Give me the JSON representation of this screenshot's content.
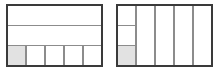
{
  "figure": {
    "background_color": "#ffffff",
    "stroke_color": "#3a3a3a",
    "inner_stroke_color": "#8c8c8c",
    "shade_color": "#e2e2e2",
    "outer_stroke_width": 2,
    "inner_stroke_width": 1.6
  },
  "models": [
    {
      "name": "left-model",
      "label": "rows-then-columns",
      "x": 7,
      "y": 5,
      "width": 95,
      "height": 61,
      "primary_partition": "horizontal",
      "primary_count": 3,
      "secondary_partition": "vertical",
      "secondary_count": 5,
      "secondary_in_band": 3,
      "total_parts": 15,
      "shaded_parts": 1,
      "shaded_cell": {
        "row": 3,
        "column": 1
      },
      "fraction": "1/15",
      "band_dividers_y": [
        25.33,
        45.67
      ],
      "cell_dividers_x": [
        26,
        45,
        64,
        83
      ]
    },
    {
      "name": "right-model",
      "label": "columns-then-rows",
      "x": 117,
      "y": 5,
      "width": 95,
      "height": 61,
      "primary_partition": "vertical",
      "primary_count": 5,
      "secondary_partition": "horizontal",
      "secondary_count": 3,
      "secondary_in_band": 1,
      "total_parts": 15,
      "shaded_parts": 1,
      "shaded_cell": {
        "row": 3,
        "column": 1
      },
      "fraction": "1/15",
      "band_dividers_x": [
        136,
        155,
        174,
        193
      ],
      "cell_dividers_y": [
        25.33,
        45.67
      ]
    }
  ]
}
